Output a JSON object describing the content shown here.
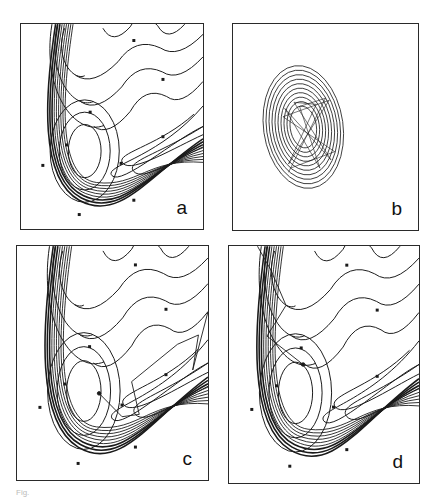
{
  "figure": {
    "caption_fragment": "Fig.",
    "panels": [
      {
        "id": "a",
        "label": "a",
        "type": "potential-contours",
        "trajectory": "none",
        "box": {
          "x": 20,
          "y": 23,
          "w": 184,
          "h": 207
        }
      },
      {
        "id": "b",
        "label": "b",
        "type": "elliptic-contours",
        "trajectory": "lissajous",
        "box": {
          "x": 232,
          "y": 23,
          "w": 187,
          "h": 208
        }
      },
      {
        "id": "c",
        "label": "c",
        "type": "potential-contours",
        "trajectory": "right-valley",
        "box": {
          "x": 16,
          "y": 245,
          "w": 193,
          "h": 236
        }
      },
      {
        "id": "d",
        "label": "d",
        "type": "potential-contours",
        "trajectory": "upper-left",
        "box": {
          "x": 228,
          "y": 245,
          "w": 192,
          "h": 239
        }
      }
    ]
  },
  "style": {
    "line_color": "#1a1a1a",
    "frame_color": "#2a2a2a",
    "background": "#ffffff"
  }
}
